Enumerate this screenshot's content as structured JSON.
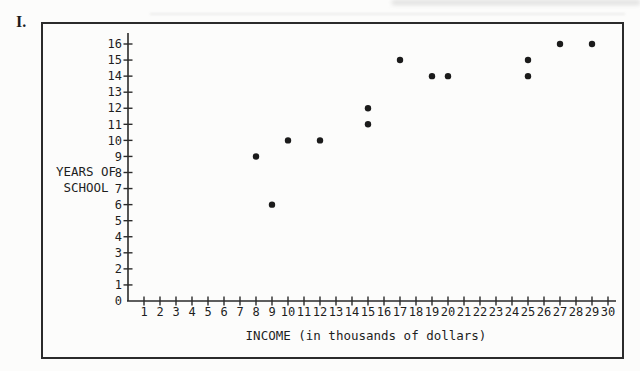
{
  "problem_label": "I.",
  "chart_data": {
    "type": "scatter",
    "title": "",
    "xlabel": "INCOME (in thousands of dollars)",
    "ylabel": "YEARS OF SCHOOL",
    "ylabel_lines": [
      "YEARS OF",
      "SCHOOL"
    ],
    "xlim": [
      0,
      30
    ],
    "ylim": [
      0,
      16
    ],
    "grid": false,
    "legend": "none",
    "x_ticks": [
      1,
      2,
      3,
      4,
      5,
      6,
      7,
      8,
      9,
      10,
      11,
      12,
      13,
      14,
      15,
      16,
      17,
      18,
      19,
      20,
      21,
      22,
      23,
      24,
      25,
      26,
      27,
      28,
      29,
      30
    ],
    "y_ticks": [
      0,
      1,
      2,
      3,
      4,
      5,
      6,
      7,
      8,
      9,
      10,
      11,
      12,
      13,
      14,
      15,
      16
    ],
    "points": [
      {
        "x": 8,
        "y": 9
      },
      {
        "x": 9,
        "y": 6
      },
      {
        "x": 10,
        "y": 10
      },
      {
        "x": 12,
        "y": 10
      },
      {
        "x": 15,
        "y": 11
      },
      {
        "x": 15,
        "y": 12
      },
      {
        "x": 17,
        "y": 15
      },
      {
        "x": 19,
        "y": 14
      },
      {
        "x": 20,
        "y": 14
      },
      {
        "x": 25,
        "y": 14
      },
      {
        "x": 25,
        "y": 15
      },
      {
        "x": 27,
        "y": 16
      },
      {
        "x": 29,
        "y": 16
      }
    ],
    "colors": {
      "point": "#1b1b1b",
      "axis": "#2a2a2a",
      "text": "#1e1e1e",
      "frame": "#2b2b2b"
    }
  }
}
